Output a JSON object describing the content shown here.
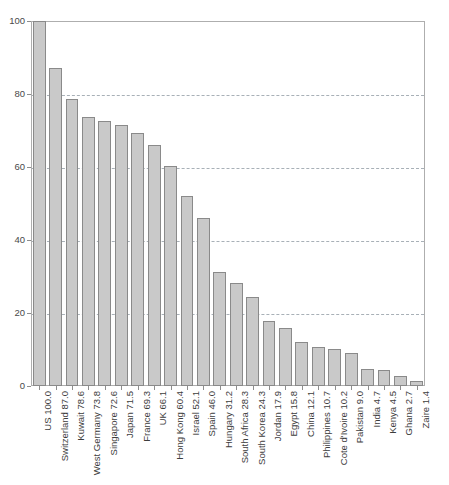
{
  "chart_data": {
    "type": "bar",
    "title": "",
    "subtitle": "",
    "xlabel": "",
    "ylabel": "",
    "ylim": [
      0,
      100
    ],
    "yticks": [
      0,
      20,
      40,
      60,
      80,
      100
    ],
    "grid": true,
    "legend": false,
    "orientation": "vertical",
    "bar_color": "#c9c9c9",
    "bar_edge_color": "#8a8a8a",
    "gridline_color": "#9aa3ab",
    "axis_color": "#aeaeae",
    "background_color": "#ffffff",
    "categories": [
      "US",
      "Switzerland",
      "Kuwait",
      "West Germany",
      "Singapore",
      "Japan",
      "France",
      "UK",
      "Hong Kong",
      "Israel",
      "Spain",
      "Hungary",
      "South Africa",
      "South Korea",
      "Jordan",
      "Egypt",
      "China",
      "Philippines",
      "Cote d'Ivoire",
      "Pakistan",
      "India",
      "Kenya",
      "Ghana",
      "Zaire"
    ],
    "values": [
      100.0,
      87.0,
      78.6,
      73.8,
      72.6,
      71.5,
      69.3,
      66.1,
      60.4,
      52.1,
      46.0,
      31.2,
      28.3,
      24.3,
      17.9,
      15.8,
      12.1,
      10.7,
      10.2,
      9.0,
      4.7,
      4.5,
      2.7,
      1.4
    ],
    "tick_labels": [
      "US 100.0",
      "Switzerland 87.0",
      "Kuwait 78.6",
      "West Germany 73.8",
      "Singapore 72.6",
      "Japan 71.5",
      "France 69.3",
      "UK 66.1",
      "Hong Kong 60.4",
      "Israel 52.1",
      "Spain 46.0",
      "Hungary 31.2",
      "South Africa 28.3",
      "South Korea 24.3",
      "Jordan 17.9",
      "Egypt 15.8",
      "China 12.1",
      "Philippines 10.7",
      "Cote d'Ivoire 10.2",
      "Pakistan 9.0",
      "India 4.7",
      "Kenya 4.5",
      "Ghana 2.7",
      "Zaire 1.4"
    ]
  }
}
